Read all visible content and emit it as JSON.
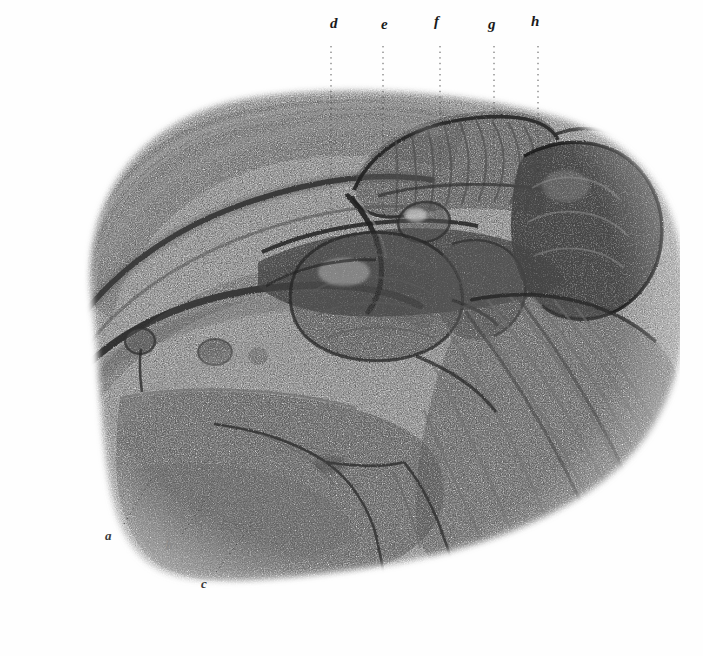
{
  "plate": {
    "kind": "anatomical-engraving",
    "medium": "stipple and line engraving",
    "background_color": "#fefefe",
    "ink_color": "#1a1a1a",
    "width": 703,
    "height": 656,
    "caption": ""
  },
  "labels": {
    "top": [
      {
        "id": "d",
        "text": "d",
        "x": 330,
        "y": 16,
        "leader_x": 331,
        "leader_y1": 46,
        "leader_y2": 250
      },
      {
        "id": "e",
        "text": "e",
        "x": 381,
        "y": 17,
        "leader_x": 383,
        "leader_y1": 46,
        "leader_y2": 215
      },
      {
        "id": "f",
        "text": "f",
        "x": 434,
        "y": 14,
        "leader_x": 440,
        "leader_y1": 46,
        "leader_y2": 205
      },
      {
        "id": "g",
        "text": "g",
        "x": 488,
        "y": 17,
        "leader_x": 494,
        "leader_y1": 46,
        "leader_y2": 190
      },
      {
        "id": "h",
        "text": "h",
        "x": 531,
        "y": 14,
        "leader_x": 538,
        "leader_y1": 46,
        "leader_y2": 175
      }
    ],
    "bottom": [
      {
        "id": "a",
        "text": "a",
        "x": 105,
        "y": 529,
        "leader_x1": 124,
        "leader_y1": 524,
        "leader_x2": 152,
        "leader_y2": 478
      },
      {
        "id": "b",
        "text": "b",
        "x": 166,
        "y": 539,
        "leader_x1": 182,
        "leader_y1": 534,
        "leader_x2": 214,
        "leader_y2": 488
      },
      {
        "id": "c",
        "text": "c",
        "x": 201,
        "y": 577,
        "leader_x1": 216,
        "leader_y1": 572,
        "leader_x2": 252,
        "leader_y2": 524
      }
    ]
  },
  "structures": [
    {
      "name": "outer-fascial-sheath",
      "description": "large sweeping flap of reflected fascia forming the upper-left border"
    },
    {
      "name": "inguinal-ligament-band",
      "description": "long dark curved band running from left edge toward centre"
    },
    {
      "name": "lymph-node-chain",
      "description": "row of small rounded nodules along the lower-left band"
    },
    {
      "name": "striated-muscle-upper",
      "description": "transversely striated muscle belly at top centre"
    },
    {
      "name": "central-organ-mass",
      "description": "large bean-shaped organ occupying the centre of the field"
    },
    {
      "name": "oval-nodule",
      "description": "small oval body lying above and right of the central mass"
    },
    {
      "name": "dark-gland-right",
      "description": "dark lobulated mass at the right of the field"
    },
    {
      "name": "vessel-branching",
      "description": "fine branching vessels descending through the lower centre"
    },
    {
      "name": "striated-muscle-lower-right",
      "description": "parallel diagonal muscle fibres filling the lower right"
    }
  ]
}
